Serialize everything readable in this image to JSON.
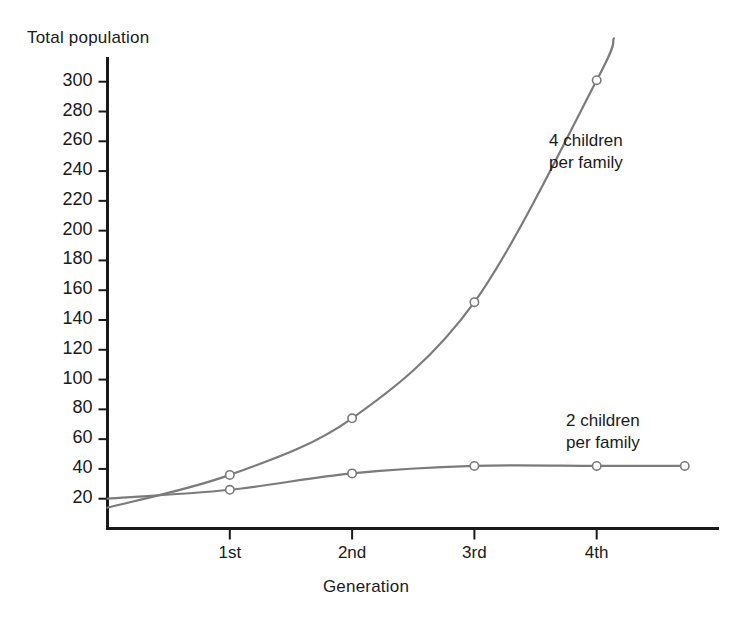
{
  "chart_data": {
    "type": "line",
    "title": "",
    "ylabel": "Total population",
    "xlabel": "Generation",
    "categories": [
      "1st",
      "2nd",
      "3rd",
      "4th"
    ],
    "x": [
      1,
      2,
      3,
      4
    ],
    "ylim": [
      0,
      310
    ],
    "xlim": [
      0,
      4.72
    ],
    "ytick_values": [
      20,
      40,
      60,
      80,
      100,
      120,
      140,
      160,
      180,
      200,
      220,
      240,
      260,
      280,
      300
    ],
    "ytick_labels": [
      "20",
      "40",
      "60",
      "80",
      "100",
      "120",
      "140",
      "160",
      "180",
      "200",
      "220",
      "240",
      "260",
      "280",
      "300"
    ],
    "xtick_labels": [
      "1st",
      "2nd",
      "3rd",
      "4th"
    ],
    "grid": false,
    "legend_position": "inline-annotation",
    "marker": "open-circle",
    "line_color": "#7b7b7b",
    "series": [
      {
        "name": "4 children per family",
        "annotation": "4 children\nper family",
        "annotation_line1": "4 children",
        "annotation_line2": "per family",
        "x": [
          0,
          1,
          2,
          3,
          4
        ],
        "values": [
          14,
          36,
          74,
          152,
          301
        ],
        "marker_x": [
          1,
          2,
          3,
          4
        ],
        "marker_values": [
          36,
          74,
          152,
          301
        ],
        "extends_past_axis": true
      },
      {
        "name": "2 children per family",
        "annotation": "2 children\nper family",
        "annotation_line1": "2 children",
        "annotation_line2": "per family",
        "x": [
          0,
          1,
          2,
          3,
          4,
          4.72
        ],
        "values": [
          20,
          26,
          37,
          42,
          42,
          42
        ],
        "marker_x": [
          1,
          2,
          3,
          4,
          4.72
        ],
        "marker_values": [
          26,
          37,
          42,
          42,
          42
        ],
        "extends_past_axis": false
      }
    ]
  },
  "axes": {
    "y_title": "Total population",
    "x_title": "Generation"
  },
  "colors": {
    "line": "#7b7b7b",
    "axis": "#1a1a1a",
    "text": "#1a1a1a",
    "background": "#ffffff",
    "marker_fill": "#ffffff"
  }
}
